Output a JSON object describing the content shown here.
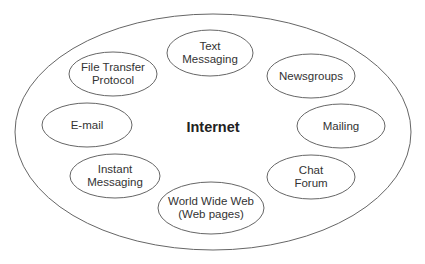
{
  "diagram": {
    "center_label": "Internet",
    "stroke_color": "#666666",
    "outer": {
      "cx": 213,
      "cy": 132,
      "rx": 198,
      "ry": 118
    },
    "nodes": [
      {
        "id": "text-messaging",
        "lines": [
          "Text",
          "Messaging"
        ],
        "cx": 210,
        "cy": 53,
        "rx": 43,
        "ry": 23
      },
      {
        "id": "file-transfer-protocol",
        "lines": [
          "File Transfer",
          "Protocol"
        ],
        "cx": 113,
        "cy": 74,
        "rx": 44,
        "ry": 22
      },
      {
        "id": "newsgroups",
        "lines": [
          "Newsgroups"
        ],
        "cx": 311,
        "cy": 76,
        "rx": 44,
        "ry": 22
      },
      {
        "id": "e-mail",
        "lines": [
          "E-mail"
        ],
        "cx": 87,
        "cy": 125,
        "rx": 45,
        "ry": 22
      },
      {
        "id": "mailing",
        "lines": [
          "Mailing"
        ],
        "cx": 341,
        "cy": 126,
        "rx": 44,
        "ry": 22
      },
      {
        "id": "instant-messaging",
        "lines": [
          "Instant",
          "Messaging"
        ],
        "cx": 115,
        "cy": 176,
        "rx": 45,
        "ry": 22
      },
      {
        "id": "chat-forum",
        "lines": [
          "Chat",
          "Forum"
        ],
        "cx": 311,
        "cy": 177,
        "rx": 44,
        "ry": 22
      },
      {
        "id": "world-wide-web",
        "lines": [
          "World Wide Web",
          "(Web pages)"
        ],
        "cx": 211,
        "cy": 208,
        "rx": 53,
        "ry": 26
      }
    ]
  }
}
